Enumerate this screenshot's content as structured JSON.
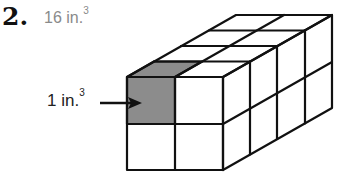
{
  "problem": {
    "number": "2.",
    "answer_value": "16 in.",
    "answer_exponent": "3"
  },
  "unit_cube_label": {
    "value": "1 in.",
    "exponent": "3"
  },
  "diagram": {
    "shape": "rectangular prism made of unit cubes",
    "width_cubes": 2,
    "height_cubes": 2,
    "depth_cubes": 4,
    "total_cubes": 16,
    "highlighted_cube": "front top-left",
    "highlight_color": "#8c8c8c",
    "line_color": "#111111"
  }
}
